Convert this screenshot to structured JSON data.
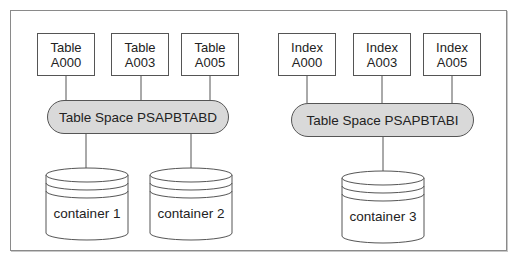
{
  "left_group": {
    "objects": [
      {
        "type": "Table",
        "name": "A000"
      },
      {
        "type": "Table",
        "name": "A003"
      },
      {
        "type": "Table",
        "name": "A005"
      }
    ],
    "tablespace": "Table Space PSAPBTABD",
    "containers": [
      "container 1",
      "container 2"
    ]
  },
  "right_group": {
    "objects": [
      {
        "type": "Index",
        "name": "A000"
      },
      {
        "type": "Index",
        "name": "A003"
      },
      {
        "type": "Index",
        "name": "A005"
      }
    ],
    "tablespace": "Table Space PSAPBTABI",
    "containers": [
      "container 3"
    ]
  },
  "colors": {
    "tablespace_fill": "#d9d9d9",
    "stroke": "#555555",
    "frame": "#8a8a8a"
  }
}
